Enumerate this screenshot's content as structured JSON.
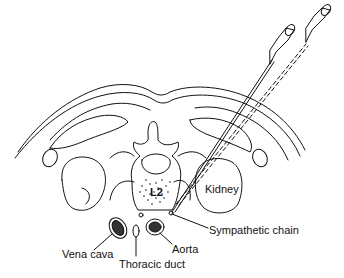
{
  "figure": {
    "type": "anatomical cross-section",
    "vertebra_label": "L2",
    "labels": {
      "kidney": "Kidney",
      "sympathetic_chain": "Sympathetic chain",
      "vena_cava": "Vena cava",
      "thoracic_duct": "Thoracic duct",
      "aorta": "Aorta"
    },
    "needles": 2
  }
}
